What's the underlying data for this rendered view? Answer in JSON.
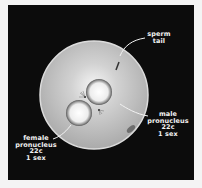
{
  "diagram": {
    "colors": {
      "background": "#0c0c0c",
      "egg_fill": "#b9b9b9",
      "egg_rim": "#d6d6d6",
      "pronucleus_fill": "#f2f2f2",
      "pronucleus_rim": "#5a5a5a",
      "label_text": "#f2f2f2"
    },
    "labels": {
      "sperm_tail": {
        "line1": "sperm",
        "line2": "tail"
      },
      "male_pronucleus": {
        "line1": "male",
        "line2": "pronucleus",
        "line3": "22c",
        "line4": "1 sex"
      },
      "female_pronucleus": {
        "line1": "female",
        "line2": "pronucleus",
        "line3": "22c",
        "line4": "1 sex"
      }
    }
  }
}
